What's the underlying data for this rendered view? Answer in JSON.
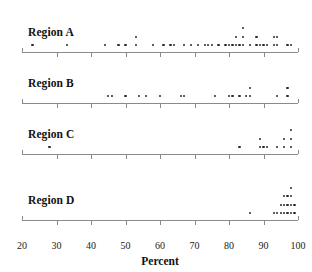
{
  "chart_data": {
    "type": "scatter",
    "title": "",
    "subtitle": "",
    "xlabel": "Percent",
    "ylabel": "",
    "xlim": [
      20,
      100
    ],
    "xticks": [
      20,
      30,
      40,
      50,
      60,
      70,
      80,
      90,
      100
    ],
    "xticklabels": [
      "20",
      "30",
      "40",
      "50",
      "60",
      "70",
      "80",
      "90",
      "100"
    ],
    "grid": false,
    "legend": "none",
    "plot_style": "stacked dot plot (one dot per observation, stacked vertically at repeated values)",
    "dot_color": "#2a2a2a",
    "axis_color": "#8a8a8a",
    "panels": [
      {
        "label": "Region A",
        "values": [
          23,
          33,
          44,
          48,
          50,
          53,
          58,
          61,
          62,
          67,
          70,
          72,
          74,
          74.5,
          75.5,
          78,
          79,
          80,
          81,
          82,
          82,
          84,
          85,
          87,
          88,
          89,
          88.5,
          90.5,
          93,
          94.5,
          97
        ],
        "stacks": [
          {
            "value": 23,
            "count": 1
          },
          {
            "value": 33,
            "count": 1
          },
          {
            "value": 44,
            "count": 1
          },
          {
            "value": 48,
            "count": 1
          },
          {
            "value": 50,
            "count": 1
          },
          {
            "value": 53,
            "count": 2
          },
          {
            "value": 58,
            "count": 1
          },
          {
            "value": 61,
            "count": 1
          },
          {
            "value": 63,
            "count": 1
          },
          {
            "value": 64,
            "count": 1
          },
          {
            "value": 67,
            "count": 1
          },
          {
            "value": 69,
            "count": 1
          },
          {
            "value": 71,
            "count": 1
          },
          {
            "value": 73,
            "count": 1
          },
          {
            "value": 74,
            "count": 1
          },
          {
            "value": 75,
            "count": 1
          },
          {
            "value": 77,
            "count": 1
          },
          {
            "value": 79,
            "count": 1
          },
          {
            "value": 80,
            "count": 1
          },
          {
            "value": 81,
            "count": 1
          },
          {
            "value": 82,
            "count": 2
          },
          {
            "value": 83,
            "count": 1
          },
          {
            "value": 84,
            "count": 3
          },
          {
            "value": 86,
            "count": 1
          },
          {
            "value": 88,
            "count": 2
          },
          {
            "value": 89,
            "count": 1
          },
          {
            "value": 90,
            "count": 1
          },
          {
            "value": 91,
            "count": 1
          },
          {
            "value": 93,
            "count": 2
          },
          {
            "value": 94,
            "count": 2
          },
          {
            "value": 97,
            "count": 1
          },
          {
            "value": 98,
            "count": 1
          }
        ]
      },
      {
        "label": "Region B",
        "stacks": [
          {
            "value": 45,
            "count": 1
          },
          {
            "value": 46,
            "count": 1
          },
          {
            "value": 50,
            "count": 1
          },
          {
            "value": 54,
            "count": 1
          },
          {
            "value": 56,
            "count": 1
          },
          {
            "value": 60,
            "count": 1
          },
          {
            "value": 66,
            "count": 1
          },
          {
            "value": 67,
            "count": 1
          },
          {
            "value": 76,
            "count": 1
          },
          {
            "value": 80,
            "count": 1
          },
          {
            "value": 81,
            "count": 1
          },
          {
            "value": 83,
            "count": 1
          },
          {
            "value": 85,
            "count": 1
          },
          {
            "value": 86,
            "count": 2
          },
          {
            "value": 94,
            "count": 1
          },
          {
            "value": 97,
            "count": 2
          }
        ]
      },
      {
        "label": "Region C",
        "stacks": [
          {
            "value": 28,
            "count": 1
          },
          {
            "value": 83,
            "count": 1
          },
          {
            "value": 89,
            "count": 2
          },
          {
            "value": 90,
            "count": 1
          },
          {
            "value": 91,
            "count": 1
          },
          {
            "value": 94,
            "count": 1
          },
          {
            "value": 96,
            "count": 2
          },
          {
            "value": 98,
            "count": 3
          }
        ]
      },
      {
        "label": "Region D",
        "stacks": [
          {
            "value": 86,
            "count": 1
          },
          {
            "value": 93,
            "count": 1
          },
          {
            "value": 94,
            "count": 1
          },
          {
            "value": 95,
            "count": 2
          },
          {
            "value": 96,
            "count": 3
          },
          {
            "value": 97,
            "count": 3
          },
          {
            "value": 98,
            "count": 4
          },
          {
            "value": 99,
            "count": 2
          }
        ]
      }
    ]
  }
}
